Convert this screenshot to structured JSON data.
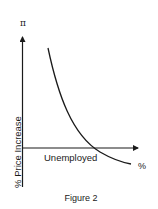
{
  "figure": {
    "caption": "Figure 2",
    "y_axis_symbol": "π",
    "y_axis_label": "% Price Increase",
    "x_axis_label": "Unemployed",
    "x_axis_unit": "%"
  },
  "colors": {
    "line": "#1a1a1a",
    "background": "#ffffff"
  },
  "diagram": {
    "type": "Phillips curve"
  }
}
